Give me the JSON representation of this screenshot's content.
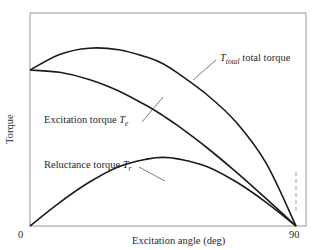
{
  "chart_data": {
    "type": "line",
    "title": "",
    "xlabel": "Excitation angle (deg)",
    "ylabel": "Torque",
    "xlim": [
      0,
      90
    ],
    "x_ticks": [
      "0",
      "90"
    ],
    "grid": false,
    "legend": "inline annotations",
    "x": [
      0,
      10,
      20,
      30,
      40,
      45,
      50,
      60,
      70,
      80,
      90
    ],
    "series": [
      {
        "name": "T_total total torque",
        "label_main": "T",
        "label_sub": "total",
        "label_rest": " total torque",
        "values": [
          1.0,
          1.1,
          1.14,
          1.13,
          1.08,
          1.04,
          0.98,
          0.84,
          0.66,
          0.4,
          0.0
        ]
      },
      {
        "name": "Excitation torque T_e",
        "label_text": "Excitation torque ",
        "label_main": "T",
        "label_sub": "e",
        "values": [
          1.0,
          0.985,
          0.94,
          0.866,
          0.766,
          0.707,
          0.643,
          0.5,
          0.342,
          0.174,
          0.0
        ]
      },
      {
        "name": "Reluctance torque T_r",
        "label_text": "Reluctance torque ",
        "label_main": "T",
        "label_sub": "r",
        "values": [
          0.0,
          0.15,
          0.28,
          0.38,
          0.43,
          0.44,
          0.43,
          0.38,
          0.28,
          0.15,
          0.0
        ]
      }
    ],
    "annotations": [
      "dashed vertical marker at 90 deg"
    ]
  },
  "axes": {
    "x_tick_0": "0",
    "x_tick_90": "90",
    "xlabel": "Excitation angle (deg)",
    "ylabel": "Torque"
  },
  "labels": {
    "total_main": "T",
    "total_sub": "total",
    "total_rest": " total torque",
    "exc_text": "Excitation torque ",
    "exc_main": "T",
    "exc_sub": "e",
    "rel_text": "Reluctance torque ",
    "rel_main": "T",
    "rel_sub": "r"
  },
  "colors": {
    "curve": "#1a1a1a",
    "frame": "#8a8a8a",
    "leader": "#444444"
  }
}
